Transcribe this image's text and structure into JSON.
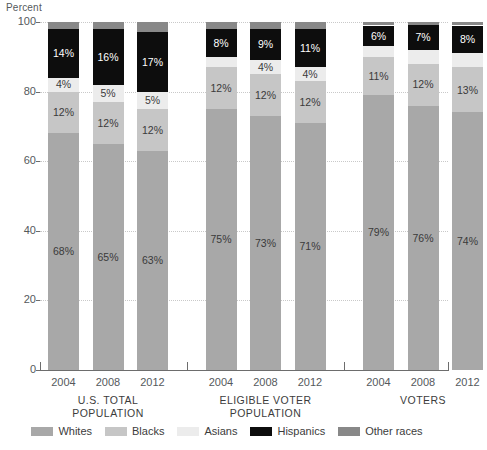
{
  "chart_data": {
    "type": "bar",
    "subtype": "stacked-bar-100",
    "title": "",
    "xlabel": "",
    "ylabel": "Percent",
    "ylim": [
      0,
      100
    ],
    "yticks": [
      0,
      20,
      40,
      60,
      80,
      100
    ],
    "grid": true,
    "legend_position": "bottom",
    "categories": [
      "2004",
      "2008",
      "2012",
      "2004",
      "2008",
      "2012",
      "2004",
      "2008",
      "2012"
    ],
    "groups": [
      {
        "label": "U.S. TOTAL\nPOPULATION",
        "line1": "U.S. TOTAL",
        "line2": "POPULATION",
        "categories": [
          "2004",
          "2008",
          "2012"
        ]
      },
      {
        "label": "ELIGIBLE VOTER\nPOPULATION",
        "line1": "ELIGIBLE VOTER",
        "line2": "POPULATION",
        "categories": [
          "2004",
          "2008",
          "2012"
        ]
      },
      {
        "label": "VOTERS",
        "line1": "VOTERS",
        "line2": "",
        "categories": [
          "2004",
          "2008",
          "2012"
        ]
      }
    ],
    "series": [
      {
        "name": "Whites",
        "color": "#a8a8a8",
        "values": [
          68,
          65,
          63,
          75,
          73,
          71,
          79,
          76,
          74
        ]
      },
      {
        "name": "Blacks",
        "color": "#c6c6c6",
        "values": [
          12,
          12,
          12,
          12,
          12,
          12,
          11,
          12,
          13
        ]
      },
      {
        "name": "Asians",
        "color": "#ececec",
        "values": [
          4,
          5,
          5,
          3,
          4,
          4,
          3,
          4,
          4
        ]
      },
      {
        "name": "Hispanics",
        "color": "#0d0d0d",
        "values": [
          14,
          16,
          17,
          8,
          9,
          11,
          6,
          7,
          8
        ]
      },
      {
        "name": "Other races",
        "color": "#888888",
        "values": [
          2,
          2,
          3,
          2,
          2,
          2,
          1,
          1,
          1
        ]
      }
    ],
    "bar_labels": [
      {
        "bar": 0,
        "labels": [
          {
            "series": "Whites",
            "text": "68%"
          },
          {
            "series": "Blacks",
            "text": "12%"
          },
          {
            "series": "Asians",
            "text": "4%"
          },
          {
            "series": "Hispanics",
            "text": "14%"
          }
        ]
      },
      {
        "bar": 1,
        "labels": [
          {
            "series": "Whites",
            "text": "65%"
          },
          {
            "series": "Blacks",
            "text": "12%"
          },
          {
            "series": "Asians",
            "text": "5%"
          },
          {
            "series": "Hispanics",
            "text": "16%"
          }
        ]
      },
      {
        "bar": 2,
        "labels": [
          {
            "series": "Whites",
            "text": "63%"
          },
          {
            "series": "Blacks",
            "text": "12%"
          },
          {
            "series": "Asians",
            "text": "5%"
          },
          {
            "series": "Hispanics",
            "text": "17%"
          }
        ]
      },
      {
        "bar": 3,
        "labels": [
          {
            "series": "Whites",
            "text": "75%"
          },
          {
            "series": "Blacks",
            "text": "12%"
          },
          {
            "series": "Asians",
            "text": ""
          },
          {
            "series": "Hispanics",
            "text": "8%"
          }
        ]
      },
      {
        "bar": 4,
        "labels": [
          {
            "series": "Whites",
            "text": "73%"
          },
          {
            "series": "Blacks",
            "text": "12%"
          },
          {
            "series": "Asians",
            "text": "4%"
          },
          {
            "series": "Hispanics",
            "text": "9%"
          }
        ]
      },
      {
        "bar": 5,
        "labels": [
          {
            "series": "Whites",
            "text": "71%"
          },
          {
            "series": "Blacks",
            "text": "12%"
          },
          {
            "series": "Asians",
            "text": "4%"
          },
          {
            "series": "Hispanics",
            "text": "11%"
          }
        ]
      },
      {
        "bar": 6,
        "labels": [
          {
            "series": "Whites",
            "text": "79%"
          },
          {
            "series": "Blacks",
            "text": "11%"
          },
          {
            "series": "Asians",
            "text": ""
          },
          {
            "series": "Hispanics",
            "text": "6%"
          }
        ]
      },
      {
        "bar": 7,
        "labels": [
          {
            "series": "Whites",
            "text": "76%"
          },
          {
            "series": "Blacks",
            "text": "12%"
          },
          {
            "series": "Asians",
            "text": ""
          },
          {
            "series": "Hispanics",
            "text": "7%"
          }
        ]
      },
      {
        "bar": 8,
        "labels": [
          {
            "series": "Whites",
            "text": "74%"
          },
          {
            "series": "Blacks",
            "text": "13%"
          },
          {
            "series": "Asians",
            "text": ""
          },
          {
            "series": "Hispanics",
            "text": "8%"
          }
        ]
      }
    ]
  },
  "axis": {
    "y_title": "Percent",
    "y_tick_labels": [
      "100",
      "80",
      "60",
      "40",
      "20",
      "0"
    ]
  },
  "legend": {
    "items": [
      {
        "label": "Whites",
        "color": "#a8a8a8"
      },
      {
        "label": "Blacks",
        "color": "#c6c6c6"
      },
      {
        "label": "Asians",
        "color": "#ececec"
      },
      {
        "label": "Hispanics",
        "color": "#0d0d0d"
      },
      {
        "label": "Other races",
        "color": "#888888"
      }
    ]
  }
}
